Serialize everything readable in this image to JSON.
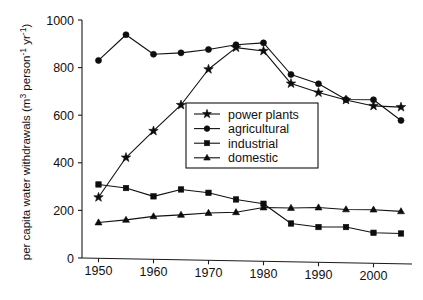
{
  "chart_data": {
    "type": "line",
    "title": "",
    "xlabel": "",
    "ylabel": "per capita water withdrawals (m3 person-1 yr-1)",
    "ylabel_parts": {
      "lead": "per capita water withdrawals (m",
      "sup1": "3",
      "mid": " person",
      "sup2": "-1",
      "mid2": " yr",
      "sup3": "-1",
      "tail": ")"
    },
    "x": [
      1950,
      1955,
      1960,
      1965,
      1970,
      1975,
      1980,
      1985,
      1990,
      1995,
      2000,
      2005
    ],
    "xlim": [
      1947,
      2007
    ],
    "ylim": [
      0,
      1000
    ],
    "xticks": [
      1950,
      1960,
      1970,
      1980,
      1990,
      2000
    ],
    "xtick_labels": [
      "1950",
      "1960",
      "1970",
      "1980",
      "1990",
      "2000"
    ],
    "yticks": [
      0,
      200,
      400,
      600,
      800,
      1000
    ],
    "ytick_labels": [
      "0",
      "200",
      "400",
      "600",
      "800",
      "1000"
    ],
    "grid": false,
    "legend_position": "center",
    "series": [
      {
        "name": "power plants",
        "marker": "star",
        "values": [
          255,
          422,
          534,
          643,
          793,
          884,
          870,
          733,
          695,
          664,
          639,
          634
        ]
      },
      {
        "name": "agricultural",
        "marker": "circle",
        "values": [
          830,
          938,
          856,
          862,
          876,
          896,
          904,
          771,
          732,
          666,
          665,
          578
        ]
      },
      {
        "name": "industrial",
        "marker": "square",
        "values": [
          309,
          294,
          259,
          288,
          274,
          246,
          228,
          145,
          130,
          130,
          106,
          103
        ]
      },
      {
        "name": "domestic",
        "marker": "triangle",
        "values": [
          149,
          160,
          175,
          181,
          189,
          192,
          212,
          210,
          212,
          204,
          203,
          196
        ]
      }
    ]
  },
  "legend": {
    "entries": [
      {
        "label": "power plants",
        "marker": "star"
      },
      {
        "label": "agricultural",
        "marker": "circle"
      },
      {
        "label": "industrial",
        "marker": "square"
      },
      {
        "label": "domestic",
        "marker": "triangle"
      }
    ]
  },
  "colors": {
    "ink": "#111111",
    "background": "#ffffff"
  }
}
